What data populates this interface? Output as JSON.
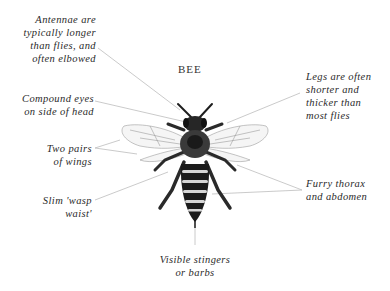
{
  "title": "BEE",
  "labels": {
    "antennae": "Antennae are\ntypically longer\nthan flies, and\noften elbowed",
    "eyes": "Compound eyes\non side of head",
    "wings": "Two pairs\nof wings",
    "waist": "Slim 'wasp\nwaist'",
    "legs": "Legs are often\nshorter and\nthicker than\nmost flies",
    "fur": "Furry thorax\nand abdomen",
    "stinger": "Visible stingers\nor barbs"
  },
  "colors": {
    "leader_line": "#b8b8b8",
    "text": "#2a2a2a",
    "bee_dark": "#1a1a1a",
    "bee_light": "#d8d8d8"
  }
}
